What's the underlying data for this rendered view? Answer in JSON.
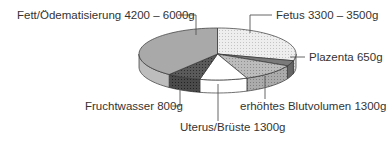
{
  "chart_data": {
    "type": "pie",
    "style": "3d-exploded-none",
    "title": "",
    "units": "g",
    "slices": [
      {
        "key": "fetus",
        "label": "Fetus 3300 – 3500g",
        "name": "Fetus",
        "value_text": "3300 – 3500g",
        "value": 3400,
        "start_deg": 0,
        "end_deg": 105,
        "top_color": "#ececec",
        "side_color": "#d6d6d6",
        "pattern": "dots-light"
      },
      {
        "key": "plazenta",
        "label": "Plazenta 650g",
        "name": "Plazenta",
        "value_text": "650g",
        "value": 650,
        "start_deg": 105,
        "end_deg": 117,
        "top_color": "#7a7a7a",
        "side_color": "#666666",
        "pattern": "none"
      },
      {
        "key": "blutvolumen",
        "label": "erhöhtes Blutvolumen 1300g",
        "name": "erhöhtes Blutvolumen",
        "value_text": "1300g",
        "value": 1300,
        "start_deg": 117,
        "end_deg": 158,
        "top_color": "#b4b4b4",
        "side_color": "#a6a6a6",
        "pattern": "dots"
      },
      {
        "key": "uterus",
        "label": "Uterus/Brüste 1300g",
        "name": "Uterus/Brüste",
        "value_text": "1300g",
        "value": 1300,
        "start_deg": 158,
        "end_deg": 193,
        "top_color": "#ffffff",
        "side_color": "#ffffff",
        "pattern": "none"
      },
      {
        "key": "fruchtwasser",
        "label": "Fruchtwasser 800g",
        "name": "Fruchtwasser",
        "value_text": "800g",
        "value": 800,
        "start_deg": 193,
        "end_deg": 218,
        "top_color": "#585858",
        "side_color": "#484848",
        "pattern": "dots-dark"
      },
      {
        "key": "fett",
        "label": "Fett/Ödematisierung 4200 – 6000g",
        "name": "Fett/Ödematisierung",
        "value_text": "4200 – 6000g",
        "value": 5100,
        "start_deg": 218,
        "end_deg": 360,
        "top_color": "#a9a9a9",
        "side_color": "#bdbdbd",
        "pattern": "none"
      }
    ],
    "geometry": {
      "cx": 217.5,
      "cy": 54,
      "rx": 78.5,
      "ry": 26,
      "depth": 13
    },
    "labels": [
      {
        "key": "fett",
        "text": "Fett/Ödematisierung 4200 – 6000g",
        "x": 17,
        "y": 19,
        "anchor": "start",
        "leader": [
          [
            178,
            15
          ],
          [
            196,
            15
          ],
          [
            196,
            35
          ]
        ]
      },
      {
        "key": "fetus",
        "text": "Fetus 3300 – 3500g",
        "x": 276,
        "y": 19,
        "anchor": "start",
        "leader": [
          [
            272,
            15
          ],
          [
            250,
            15
          ],
          [
            250,
            33
          ]
        ]
      },
      {
        "key": "plazenta",
        "text": "Plazenta 650g",
        "x": 309,
        "y": 61,
        "anchor": "start",
        "leader": [
          [
            305,
            57
          ],
          [
            290,
            57
          ]
        ]
      },
      {
        "key": "blutvolumen",
        "text": "erhöhtes Blutvolumen 1300g",
        "x": 240,
        "y": 110,
        "anchor": "start",
        "leader": [
          [
            265,
            99
          ],
          [
            265,
            76
          ]
        ]
      },
      {
        "key": "fruchtwasser",
        "text": "Fruchtwasser 800g",
        "x": 85,
        "y": 110,
        "anchor": "start",
        "leader": [
          [
            172,
            106
          ],
          [
            180,
            106
          ],
          [
            180,
            88
          ]
        ]
      },
      {
        "key": "uterus",
        "text": "Uterus/Brüste 1300g",
        "x": 180,
        "y": 131,
        "anchor": "start",
        "leader": [
          [
            218,
            121
          ],
          [
            218,
            84
          ]
        ]
      }
    ],
    "legend": "none (callout labels)",
    "grid": false
  }
}
